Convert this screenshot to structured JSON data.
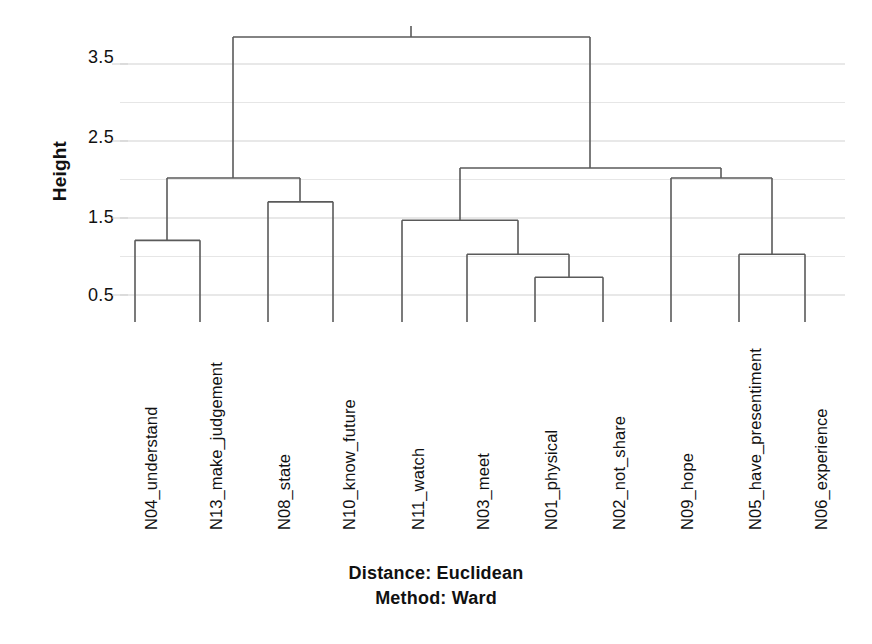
{
  "axis": {
    "y_title": "Height",
    "tick_labels": [
      "3.5",
      "2.5",
      "1.5",
      "0.5"
    ]
  },
  "caption": {
    "distance": "Distance: Euclidean",
    "method": "Method: Ward"
  },
  "chart_data": {
    "type": "dendrogram",
    "title": "",
    "xlabel": "",
    "ylabel": "Height",
    "ylim": [
      0.5,
      4.0
    ],
    "yticks": [
      0.5,
      1.5,
      2.5,
      3.5
    ],
    "gridlines": [
      0.5,
      1.0,
      1.5,
      2.0,
      2.5,
      3.0,
      3.5
    ],
    "grid": true,
    "legend": "none",
    "distance_metric": "Euclidean",
    "linkage_method": "Ward",
    "leaf_order": [
      "N04_understand",
      "N13_make_judgement",
      "N08_state",
      "N10_know_future",
      "N11_watch",
      "N03_meet",
      "N01_physical",
      "N02_not_share",
      "N09_hope",
      "N05_have_presentiment",
      "N06_experience"
    ],
    "leaf_x": [
      135,
      200,
      268,
      333,
      402,
      467,
      535,
      603,
      671,
      739,
      805
    ],
    "merges": [
      {
        "id": "m1",
        "left": "N01_physical",
        "right": "N02_not_share",
        "height": 0.73,
        "x": 569
      },
      {
        "id": "m2",
        "left": "N03_meet",
        "right": "m1",
        "height": 1.03,
        "x": 518
      },
      {
        "id": "m3",
        "left": "N05_have_presentiment",
        "right": "N06_experience",
        "height": 1.03,
        "x": 772
      },
      {
        "id": "m4",
        "left": "N04_understand",
        "right": "N13_make_judgement",
        "height": 1.21,
        "x": 167
      },
      {
        "id": "m5",
        "left": "N11_watch",
        "right": "m2",
        "height": 1.47,
        "x": 460
      },
      {
        "id": "m6",
        "left": "N08_state",
        "right": "N10_know_future",
        "height": 1.71,
        "x": 300
      },
      {
        "id": "m7",
        "left": "m4",
        "right": "m6",
        "height": 2.02,
        "x": 233
      },
      {
        "id": "m8",
        "left": "N09_hope",
        "right": "m3",
        "height": 2.02,
        "x": 721
      },
      {
        "id": "m9",
        "left": "m5",
        "right": "m8",
        "height": 2.15,
        "x": 590
      },
      {
        "id": "m10",
        "left": "m7",
        "right": "m9",
        "height": 3.85,
        "x": 411
      }
    ],
    "colors": {
      "link": "#5a5a5a",
      "grid": "#cfcfcf",
      "axis_text": "#111111",
      "background": "#ffffff"
    }
  }
}
